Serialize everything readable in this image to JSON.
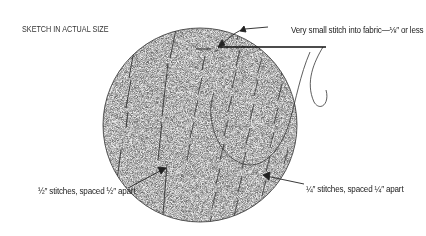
{
  "title": "SKETCH IN ACTUAL SIZE",
  "annotations": {
    "top": "Very small stitch into fabric—⅛″ or less",
    "left": "½″ stitches, spaced ½″ apart",
    "right": "¼″ stitches, spaced ¼″ apart"
  },
  "colors": {
    "line": "#222222",
    "fabric": "#e6e6e6",
    "background": "#ffffff"
  }
}
